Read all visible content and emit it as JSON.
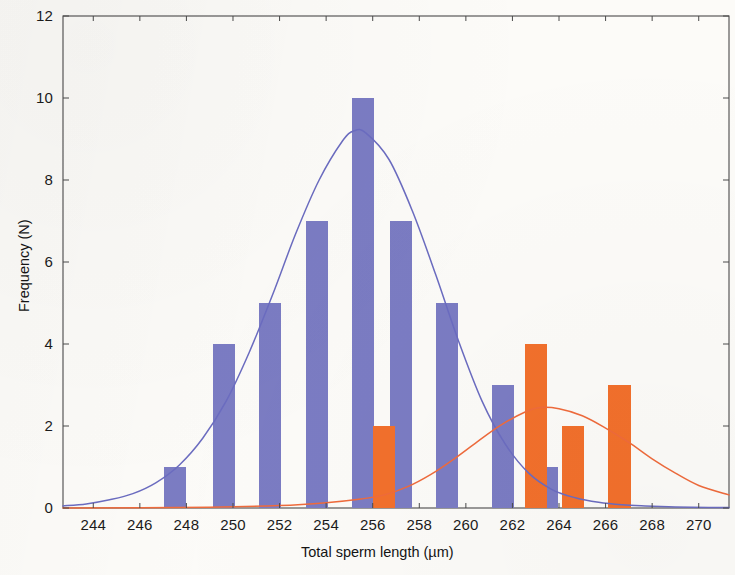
{
  "chart_data": {
    "type": "bar",
    "title": "",
    "subtitle": "",
    "xlabel": "Total sperm length (µm)",
    "ylabel": "Frequency (N)",
    "xlim": [
      242.7,
      271.3
    ],
    "ylim": [
      0,
      12
    ],
    "xticks": [
      244,
      246,
      248,
      250,
      252,
      254,
      256,
      258,
      260,
      262,
      264,
      266,
      268,
      270
    ],
    "yticks": [
      0,
      2,
      4,
      6,
      8,
      10,
      12
    ],
    "xtick_labels": [
      "244",
      "246",
      "248",
      "250",
      "252",
      "254",
      "256",
      "258",
      "260",
      "262",
      "264",
      "266",
      "268",
      "270"
    ],
    "ytick_labels": [
      "0",
      "2",
      "4",
      "6",
      "8",
      "10",
      "12"
    ],
    "grid": false,
    "legend": "none",
    "bar_width": 0.95,
    "series": [
      {
        "name": "Population A (blue histogram)",
        "color": "#7b7cc3",
        "type": "bar",
        "x": [
          247.5,
          249.6,
          251.6,
          253.6,
          255.6,
          257.2,
          259.2,
          261.6,
          263.5
        ],
        "values": [
          1,
          4,
          5,
          7,
          10,
          7,
          5,
          3,
          1
        ]
      },
      {
        "name": "Population B (orange histogram)",
        "color": "#f2702c",
        "type": "bar",
        "x": [
          256.5,
          263.0,
          264.6,
          266.6
        ],
        "values": [
          2,
          4,
          2,
          3
        ]
      },
      {
        "name": "Normal fit A (blue curve)",
        "color": "#6b6cc0",
        "type": "line",
        "mean": 255.2,
        "sd": 2.85,
        "peak": 9.2,
        "x": [
          242.7,
          243.7,
          244.7,
          245.7,
          246.7,
          247.7,
          248.7,
          249.7,
          250.7,
          251.7,
          252.7,
          253.7,
          254.7,
          255.2,
          255.7,
          256.7,
          257.7,
          258.7,
          259.7,
          260.7,
          261.7,
          262.7,
          263.7,
          264.7,
          265.7,
          266.7,
          267.7,
          268.7,
          269.7,
          271.3
        ],
        "values": [
          0.05,
          0.1,
          0.2,
          0.35,
          0.62,
          1.05,
          1.7,
          2.6,
          3.8,
          5.2,
          6.7,
          8.0,
          8.95,
          9.2,
          9.15,
          8.5,
          7.25,
          5.7,
          4.05,
          2.6,
          1.55,
          0.85,
          0.45,
          0.25,
          0.14,
          0.08,
          0.05,
          0.03,
          0.02,
          0.01
        ]
      },
      {
        "name": "Normal fit B (orange curve)",
        "color": "#ef6b3c",
        "type": "line",
        "mean": 263.2,
        "sd": 3.3,
        "peak": 2.45,
        "x": [
          242.7,
          249.0,
          252.0,
          254.0,
          255.5,
          256.5,
          257.5,
          258.5,
          259.5,
          260.5,
          261.5,
          262.5,
          263.2,
          264.0,
          265.0,
          266.0,
          267.0,
          268.0,
          269.0,
          270.0,
          271.3
        ],
        "values": [
          0.0,
          0.02,
          0.06,
          0.13,
          0.22,
          0.32,
          0.52,
          0.82,
          1.2,
          1.62,
          2.02,
          2.33,
          2.45,
          2.42,
          2.25,
          1.95,
          1.6,
          1.2,
          0.85,
          0.55,
          0.32
        ]
      }
    ]
  },
  "axes": {
    "frame_color": "#4a4a4a",
    "tick_color": "#4a4a4a"
  }
}
